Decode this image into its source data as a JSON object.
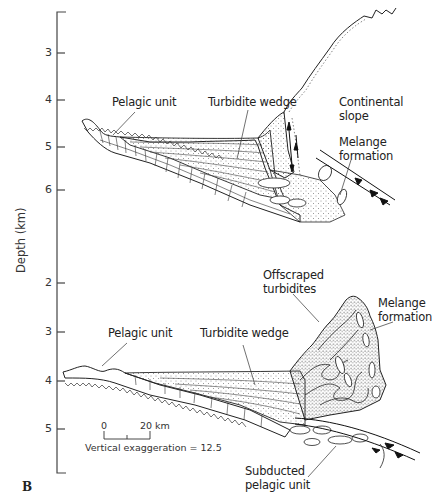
{
  "figure": {
    "panel_letter": "B",
    "y_axis": {
      "label": "Depth (km)",
      "upper_ticks": [
        "3",
        "4",
        "5",
        "6"
      ],
      "lower_ticks": [
        "2",
        "3",
        "4",
        "5"
      ]
    },
    "upper_section": {
      "labels": {
        "pelagic": "Pelagic unit",
        "turbidite": "Turbidite wedge",
        "continental": "Continental\nslope",
        "continental_line1": "Continental",
        "continental_line2": "slope",
        "melange_line1": "Melange",
        "melange_line2": "formation"
      }
    },
    "lower_section": {
      "labels": {
        "pelagic": "Pelagic unit",
        "turbidite": "Turbidite wedge",
        "offscraped_line1": "Offscraped",
        "offscraped_line2": "turbidites",
        "melange_line1": "Melange",
        "melange_line2": "formation",
        "subducted_line1": "Subducted",
        "subducted_line2": "pelagic unit"
      }
    },
    "scale_bar": {
      "start": "0",
      "end": "20 km",
      "note": "Vertical exaggeration = 12.5"
    }
  }
}
